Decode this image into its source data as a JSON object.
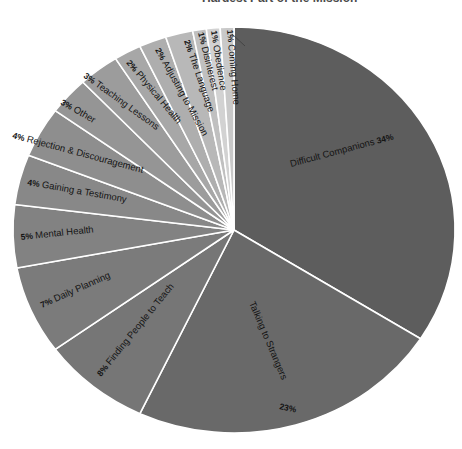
{
  "title": {
    "text": "Hardest Part of the Mission"
  },
  "chart_data": {
    "type": "pie",
    "title": "Hardest Part of the Mission",
    "unit": "%",
    "legend": "none",
    "start_angle_deg": 0,
    "direction": "clockwise",
    "slice_border_color": "#ffffff",
    "label_style": "category name with percentage, rotated along slice angle",
    "slices": [
      {
        "label": "Difficult Companions",
        "value": 34,
        "color": "#5d5d5d"
      },
      {
        "label": "Talking to Strangers",
        "value": 23,
        "color": "#696969"
      },
      {
        "label": "Finding People to Teach",
        "value": 8,
        "color": "#767676"
      },
      {
        "label": "Daily Planning",
        "value": 7,
        "color": "#7b7b7b"
      },
      {
        "label": "Mental Health",
        "value": 5,
        "color": "#828282"
      },
      {
        "label": "Gaining a Testimony",
        "value": 4,
        "color": "#888888"
      },
      {
        "label": "Rejection & Discouragement",
        "value": 4,
        "color": "#8e8e8e"
      },
      {
        "label": "Other",
        "value": 3,
        "color": "#959595"
      },
      {
        "label": "Teaching Lessons",
        "value": 3,
        "color": "#9c9c9c"
      },
      {
        "label": "Physical Health",
        "value": 2,
        "color": "#a7a7a7"
      },
      {
        "label": "Adjusting to Mission",
        "value": 2,
        "color": "#aeaeae"
      },
      {
        "label": "The Language",
        "value": 2,
        "color": "#b8b8b8"
      },
      {
        "label": "Disinterest",
        "value": 1,
        "color": "#c0c0c0"
      },
      {
        "label": "Obedience",
        "value": 1,
        "color": "#d2d2d2"
      },
      {
        "label": "Coming Home",
        "value": 1,
        "color": "#c9c9c9"
      }
    ]
  }
}
